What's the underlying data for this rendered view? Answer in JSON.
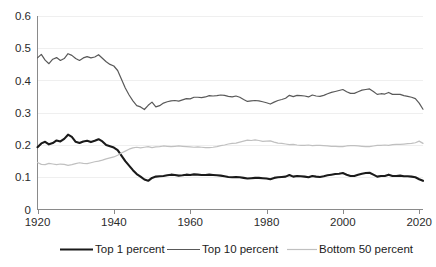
{
  "chart_data": {
    "type": "line",
    "title": "",
    "subtitle": "",
    "xlabel": "",
    "ylabel": "",
    "xlim": [
      1920,
      2021
    ],
    "ylim": [
      0,
      0.6
    ],
    "grid": true,
    "legend_position": "bottom",
    "x_ticks": [
      "1920",
      "1940",
      "1960",
      "1980",
      "2000",
      "2020"
    ],
    "x_tick_values": [
      1920,
      1940,
      1960,
      1980,
      2000,
      2020
    ],
    "y_ticks": [
      "0",
      "0.1",
      "0.2",
      "0.3",
      "0.4",
      "0.5",
      "0.6"
    ],
    "y_tick_values": [
      0,
      0.1,
      0.2,
      0.3,
      0.4,
      0.5,
      0.6
    ],
    "x": [
      1920,
      1921,
      1922,
      1923,
      1924,
      1925,
      1926,
      1927,
      1928,
      1929,
      1930,
      1931,
      1932,
      1933,
      1934,
      1935,
      1936,
      1937,
      1938,
      1939,
      1940,
      1941,
      1942,
      1943,
      1944,
      1945,
      1946,
      1947,
      1948,
      1949,
      1950,
      1951,
      1952,
      1953,
      1954,
      1955,
      1956,
      1957,
      1958,
      1959,
      1960,
      1961,
      1962,
      1963,
      1964,
      1965,
      1966,
      1967,
      1968,
      1969,
      1970,
      1971,
      1972,
      1973,
      1974,
      1975,
      1976,
      1977,
      1978,
      1979,
      1980,
      1981,
      1982,
      1983,
      1984,
      1985,
      1986,
      1987,
      1988,
      1989,
      1990,
      1991,
      1992,
      1993,
      1994,
      1995,
      1996,
      1997,
      1998,
      1999,
      2000,
      2001,
      2002,
      2003,
      2004,
      2005,
      2006,
      2007,
      2008,
      2009,
      2010,
      2011,
      2012,
      2013,
      2014,
      2015,
      2016,
      2017,
      2018,
      2019,
      2020,
      2021
    ],
    "series": [
      {
        "name": "Top 1 percent",
        "color": "#1a1a1a",
        "width": 2.1,
        "values": [
          0.193,
          0.205,
          0.21,
          0.202,
          0.206,
          0.214,
          0.211,
          0.219,
          0.232,
          0.225,
          0.21,
          0.206,
          0.211,
          0.213,
          0.209,
          0.213,
          0.218,
          0.211,
          0.2,
          0.196,
          0.192,
          0.184,
          0.167,
          0.15,
          0.136,
          0.122,
          0.11,
          0.102,
          0.093,
          0.089,
          0.098,
          0.102,
          0.103,
          0.104,
          0.106,
          0.108,
          0.107,
          0.105,
          0.106,
          0.108,
          0.107,
          0.109,
          0.108,
          0.107,
          0.107,
          0.108,
          0.107,
          0.106,
          0.105,
          0.103,
          0.101,
          0.1,
          0.101,
          0.1,
          0.098,
          0.096,
          0.097,
          0.098,
          0.098,
          0.097,
          0.096,
          0.094,
          0.098,
          0.1,
          0.101,
          0.102,
          0.107,
          0.102,
          0.104,
          0.103,
          0.102,
          0.1,
          0.104,
          0.102,
          0.101,
          0.103,
          0.106,
          0.108,
          0.11,
          0.111,
          0.113,
          0.108,
          0.104,
          0.104,
          0.108,
          0.111,
          0.113,
          0.114,
          0.108,
          0.102,
          0.104,
          0.104,
          0.108,
          0.104,
          0.104,
          0.105,
          0.103,
          0.103,
          0.102,
          0.1,
          0.094,
          0.089
        ]
      },
      {
        "name": "Top 10 percent",
        "color": "#595959",
        "width": 1.2,
        "values": [
          0.47,
          0.481,
          0.463,
          0.452,
          0.466,
          0.471,
          0.462,
          0.468,
          0.483,
          0.478,
          0.468,
          0.462,
          0.47,
          0.474,
          0.47,
          0.473,
          0.48,
          0.469,
          0.458,
          0.45,
          0.445,
          0.431,
          0.404,
          0.377,
          0.355,
          0.337,
          0.322,
          0.318,
          0.31,
          0.323,
          0.333,
          0.318,
          0.322,
          0.33,
          0.334,
          0.337,
          0.338,
          0.336,
          0.34,
          0.344,
          0.343,
          0.348,
          0.348,
          0.347,
          0.349,
          0.353,
          0.352,
          0.353,
          0.355,
          0.354,
          0.351,
          0.349,
          0.352,
          0.348,
          0.341,
          0.335,
          0.337,
          0.338,
          0.337,
          0.334,
          0.331,
          0.327,
          0.333,
          0.338,
          0.341,
          0.345,
          0.354,
          0.35,
          0.354,
          0.353,
          0.352,
          0.349,
          0.355,
          0.352,
          0.351,
          0.354,
          0.359,
          0.363,
          0.366,
          0.369,
          0.372,
          0.365,
          0.36,
          0.36,
          0.365,
          0.37,
          0.372,
          0.374,
          0.366,
          0.357,
          0.359,
          0.358,
          0.363,
          0.357,
          0.357,
          0.357,
          0.353,
          0.351,
          0.348,
          0.344,
          0.33,
          0.311
        ]
      },
      {
        "name": "Bottom 50 percent",
        "color": "#c0c0c0",
        "width": 1.2,
        "values": [
          0.146,
          0.14,
          0.139,
          0.143,
          0.141,
          0.139,
          0.141,
          0.14,
          0.137,
          0.139,
          0.142,
          0.145,
          0.143,
          0.142,
          0.145,
          0.148,
          0.15,
          0.153,
          0.157,
          0.16,
          0.163,
          0.168,
          0.175,
          0.181,
          0.187,
          0.191,
          0.193,
          0.191,
          0.193,
          0.195,
          0.192,
          0.194,
          0.195,
          0.197,
          0.196,
          0.195,
          0.196,
          0.197,
          0.196,
          0.195,
          0.194,
          0.193,
          0.194,
          0.193,
          0.192,
          0.192,
          0.193,
          0.195,
          0.198,
          0.2,
          0.203,
          0.205,
          0.206,
          0.209,
          0.212,
          0.215,
          0.214,
          0.216,
          0.214,
          0.211,
          0.212,
          0.213,
          0.209,
          0.206,
          0.205,
          0.203,
          0.201,
          0.202,
          0.2,
          0.199,
          0.199,
          0.2,
          0.198,
          0.199,
          0.199,
          0.198,
          0.197,
          0.196,
          0.196,
          0.195,
          0.195,
          0.197,
          0.198,
          0.198,
          0.197,
          0.196,
          0.195,
          0.195,
          0.197,
          0.199,
          0.199,
          0.2,
          0.199,
          0.201,
          0.202,
          0.202,
          0.203,
          0.204,
          0.205,
          0.207,
          0.212,
          0.205
        ]
      }
    ]
  },
  "legend": {
    "items": [
      {
        "label": "Top 1 percent"
      },
      {
        "label": "Top 10 percent"
      },
      {
        "label": "Bottom 50 percent"
      }
    ]
  },
  "axis_colors": {
    "axis": "#8a8a8a",
    "grid": "#efefef",
    "text": "#2b2b2b"
  }
}
